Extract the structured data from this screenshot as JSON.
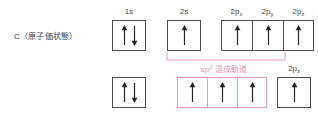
{
  "diagram": {
    "species_label": "C（原子価状態）",
    "colors": {
      "box_border": "#4d4d4d",
      "hybrid_border": "#e79db2",
      "hybrid_text": "#ef93ac",
      "arrow": "#262626",
      "label_text": "#4a4a4a",
      "background": "#ffffff"
    },
    "top_row": {
      "orbitals": [
        {
          "label": "1s",
          "sub": "",
          "electrons": "up-down",
          "box_color": "black"
        },
        {
          "label": "2s",
          "sub": "",
          "electrons": "up",
          "box_color": "black"
        },
        {
          "label": "2p",
          "sub": "x",
          "electrons": "up",
          "box_color": "black"
        },
        {
          "label": "2p",
          "sub": "y",
          "electrons": "up",
          "box_color": "black"
        },
        {
          "label": "2p",
          "sub": "z",
          "electrons": "up",
          "box_color": "black"
        }
      ]
    },
    "bottom_row": {
      "orbitals": [
        {
          "label": "",
          "sub": "",
          "electrons": "up-down",
          "box_color": "black"
        },
        {
          "label": "",
          "sub": "",
          "electrons": "up",
          "box_color": "pink"
        },
        {
          "label": "",
          "sub": "",
          "electrons": "up",
          "box_color": "pink"
        },
        {
          "label": "",
          "sub": "",
          "electrons": "up",
          "box_color": "pink"
        },
        {
          "label": "2p",
          "sub": "z",
          "electrons": "up",
          "box_color": "black"
        }
      ]
    },
    "annotation": {
      "hybrid_text": "混成軌道",
      "hybrid_prefix": "sp",
      "hybrid_exponent": "2"
    }
  }
}
